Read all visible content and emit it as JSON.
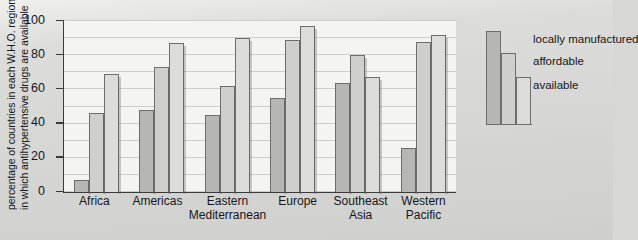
{
  "chart_data": {
    "type": "bar",
    "title": "",
    "subtitle": "",
    "xlabel": "",
    "ylabel_line1": "percentage of countries in each W.H.O. region",
    "ylabel_line2": "in which antihypertensive drugs are available",
    "ylim": [
      0,
      100
    ],
    "yticks": [
      0,
      20,
      40,
      60,
      80,
      100
    ],
    "ytick_labels": [
      "0",
      "20",
      "40",
      "60",
      "80",
      "100"
    ],
    "grid": true,
    "grid_interval": 10,
    "legend_position": "right",
    "categories": [
      "Africa",
      "Americas",
      "Eastern\nMediterranean",
      "Europe",
      "Southeast\nAsia",
      "Western\nPacific"
    ],
    "category_lines": [
      [
        "Africa"
      ],
      [
        "Americas"
      ],
      [
        "Eastern",
        "Mediterranean"
      ],
      [
        "Europe"
      ],
      [
        "Southeast",
        "Asia"
      ],
      [
        "Western",
        "Pacific"
      ]
    ],
    "series": [
      {
        "name": "locally manufactured",
        "color": "#b6b6b4",
        "values": [
          7,
          48,
          45,
          55,
          64,
          26
        ]
      },
      {
        "name": "affordable",
        "color": "#cfcfcd",
        "values": [
          46,
          73,
          62,
          89,
          80,
          88
        ]
      },
      {
        "name": "available",
        "color": "#dcdcda",
        "values": [
          69,
          87,
          90,
          97,
          67,
          92
        ]
      }
    ]
  },
  "legend": {
    "items": [
      {
        "label": "locally manufactured",
        "color": "#b6b6b4"
      },
      {
        "label": "affordable",
        "color": "#cfcfcd"
      },
      {
        "label": "available",
        "color": "#dcdcda"
      }
    ]
  },
  "colors": {
    "plot_background": "#f4f4f2",
    "figure_background": "#d9d9d7",
    "axis": "#3a3a3a",
    "gridline": "#cdcdcb",
    "bar_outline": "#6d6d6d",
    "text": "#141619"
  }
}
